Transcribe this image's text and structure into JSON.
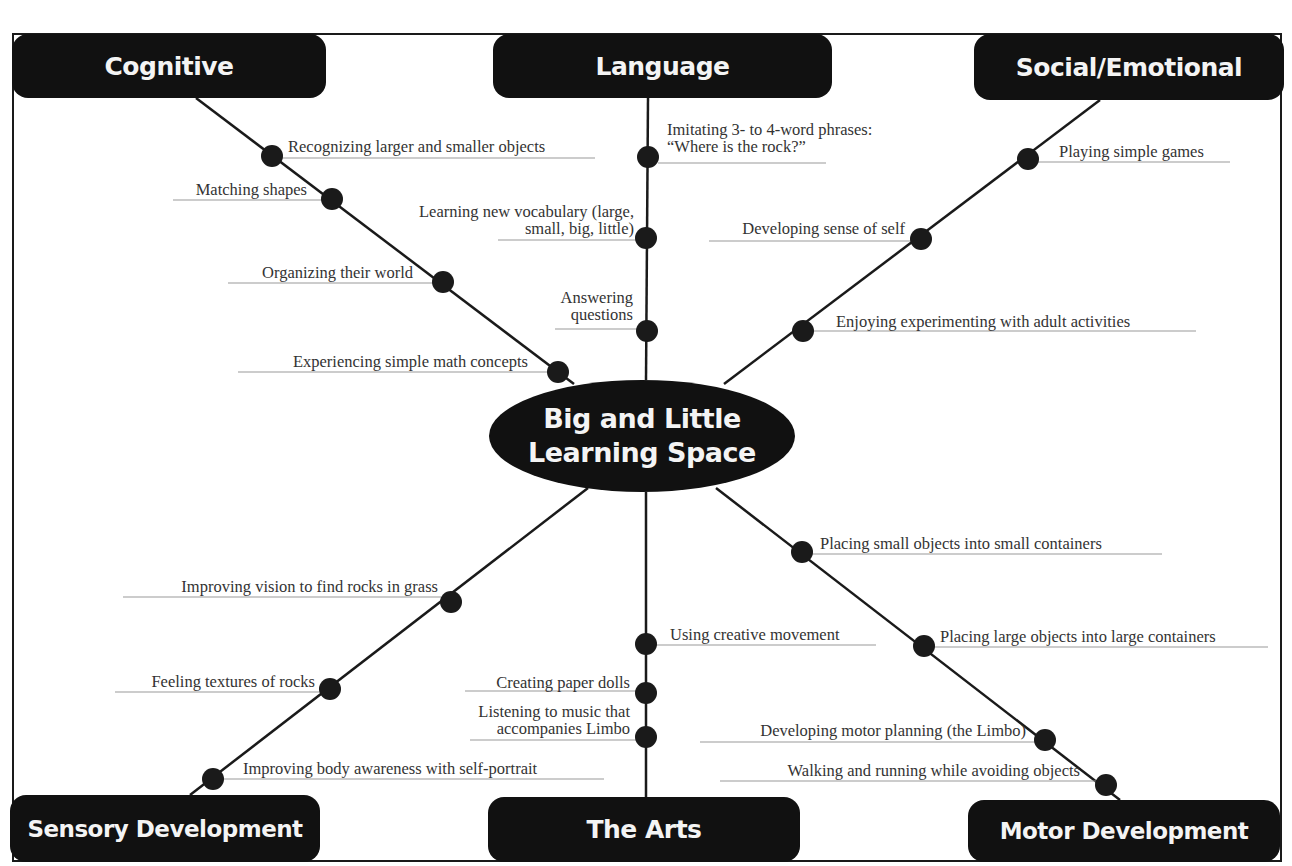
{
  "diagram": {
    "title_cropped": "",
    "center": {
      "line1": "Big and Little",
      "line2": "Learning Space",
      "cx": 642,
      "cy": 436
    },
    "colors": {
      "box_fill": "#111111",
      "box_text": "#f4f4f4",
      "line": "#1a1a1a",
      "dot": "#1a1a1a",
      "label_text": "#333333",
      "leader": "#999999"
    },
    "categories": [
      {
        "id": "cognitive",
        "label": "Cognitive",
        "x": 12,
        "y": 34,
        "w": 314,
        "h": 64,
        "font": 25,
        "anchor": [
          196,
          98
        ]
      },
      {
        "id": "language",
        "label": "Language",
        "x": 493,
        "y": 34,
        "w": 339,
        "h": 64,
        "font": 25,
        "anchor": [
          648,
          98
        ]
      },
      {
        "id": "social-emotional",
        "label": "Social/Emotional",
        "x": 974,
        "y": 34,
        "w": 310,
        "h": 66,
        "font": 25,
        "anchor": [
          1100,
          100
        ]
      },
      {
        "id": "sensory-development",
        "label": "Sensory Development",
        "x": 10,
        "y": 795,
        "w": 310,
        "h": 67,
        "font": 23,
        "anchor": [
          190,
          795
        ]
      },
      {
        "id": "the-arts",
        "label": "The Arts",
        "x": 488,
        "y": 797,
        "w": 312,
        "h": 65,
        "font": 25,
        "anchor": [
          646,
          797
        ]
      },
      {
        "id": "motor-development",
        "label": "Motor Development",
        "x": 968,
        "y": 800,
        "w": 312,
        "h": 62,
        "font": 23,
        "anchor": [
          1120,
          800
        ]
      }
    ],
    "branches": [
      {
        "category": "cognitive",
        "from": [
          196,
          98
        ],
        "to": [
          574,
          384
        ],
        "items": [
          {
            "text": [
              "Recognizing larger and smaller objects"
            ],
            "dot": [
              272,
              156
            ],
            "side": "right",
            "lx": 288,
            "ly": 138,
            "uline": [
              282,
              595,
              158
            ]
          },
          {
            "text": [
              "Matching shapes"
            ],
            "dot": [
              332,
              199
            ],
            "side": "left",
            "rx": 307,
            "ly": 181,
            "uline": [
              173,
              322,
              200
            ]
          },
          {
            "text": [
              "Organizing their world"
            ],
            "dot": [
              443,
              282
            ],
            "side": "left",
            "rx": 413,
            "ly": 264,
            "uline": [
              228,
              433,
              283
            ]
          },
          {
            "text": [
              "Experiencing simple math concepts"
            ],
            "dot": [
              558,
              372
            ],
            "side": "left",
            "rx": 528,
            "ly": 353,
            "uline": [
              238,
              548,
              372
            ]
          }
        ]
      },
      {
        "category": "language",
        "from": [
          648,
          98
        ],
        "to": [
          646,
          380
        ],
        "items": [
          {
            "text": [
              "Imitating 3- to 4-word phrases:",
              "“Where is the rock?”"
            ],
            "dot": [
              648,
              157
            ],
            "side": "right",
            "lx": 667,
            "ly": 121,
            "uline": [
              658,
              826,
              163
            ]
          },
          {
            "text": [
              "Learning new vocabulary (large,",
              "small, big, little)"
            ],
            "dot": [
              646,
              238
            ],
            "side": "left",
            "rx": 634,
            "ly": 203,
            "uline": [
              498,
              636,
              240
            ]
          },
          {
            "text": [
              "Answering",
              "questions"
            ],
            "dot": [
              647,
              331
            ],
            "side": "left",
            "rx": 633,
            "ly": 289,
            "uline": [
              555,
              637,
              329
            ]
          }
        ]
      },
      {
        "category": "social-emotional",
        "from": [
          1100,
          100
        ],
        "to": [
          724,
          384
        ],
        "items": [
          {
            "text": [
              "Playing simple games"
            ],
            "dot": [
              1028,
              159
            ],
            "side": "right",
            "lx": 1059,
            "ly": 143,
            "uline": [
              1038,
              1230,
              162
            ]
          },
          {
            "text": [
              "Developing sense of self"
            ],
            "dot": [
              921,
              239
            ],
            "side": "left",
            "rx": 905,
            "ly": 220,
            "uline": [
              709,
              911,
              241
            ]
          },
          {
            "text": [
              "Enjoying experimenting with adult activities"
            ],
            "dot": [
              803,
              331
            ],
            "side": "right",
            "lx": 836,
            "ly": 313,
            "uline": [
              813,
              1196,
              331
            ]
          }
        ]
      },
      {
        "category": "sensory-development",
        "from": [
          588,
          488
        ],
        "to": [
          190,
          795
        ],
        "items": [
          {
            "text": [
              "Improving vision to find rocks in grass"
            ],
            "dot": [
              451,
              602
            ],
            "side": "left",
            "rx": 438,
            "ly": 578,
            "uline": [
              123,
              441,
              597
            ]
          },
          {
            "text": [
              "Feeling textures of rocks"
            ],
            "dot": [
              330,
              689
            ],
            "side": "left",
            "rx": 315,
            "ly": 673,
            "uline": [
              115,
              320,
              692
            ]
          },
          {
            "text": [
              "Improving body awareness with self-portrait"
            ],
            "dot": [
              213,
              779
            ],
            "side": "right",
            "lx": 243,
            "ly": 760,
            "uline": [
              223,
              604,
              779
            ]
          }
        ]
      },
      {
        "category": "the-arts",
        "from": [
          646,
          492
        ],
        "to": [
          646,
          797
        ],
        "items": [
          {
            "text": [
              "Using creative movement"
            ],
            "dot": [
              646,
              644
            ],
            "side": "right",
            "lx": 670,
            "ly": 626,
            "uline": [
              656,
              876,
              645
            ]
          },
          {
            "text": [
              "Creating paper dolls"
            ],
            "dot": [
              646,
              693
            ],
            "side": "left",
            "rx": 630,
            "ly": 674,
            "uline": [
              465,
              636,
              691
            ]
          },
          {
            "text": [
              "Listening to music that",
              "accompanies Limbo"
            ],
            "dot": [
              646,
              737
            ],
            "side": "left",
            "rx": 630,
            "ly": 703,
            "uline": [
              470,
              636,
              740
            ]
          }
        ]
      },
      {
        "category": "motor-development",
        "from": [
          716,
          488
        ],
        "to": [
          1120,
          800
        ],
        "items": [
          {
            "text": [
              "Placing small objects into small containers"
            ],
            "dot": [
              802,
              552
            ],
            "side": "right",
            "lx": 820,
            "ly": 535,
            "uline": [
              812,
              1162,
              554
            ]
          },
          {
            "text": [
              "Placing large objects into large containers"
            ],
            "dot": [
              924,
              646
            ],
            "side": "right",
            "lx": 940,
            "ly": 628,
            "uline": [
              934,
              1268,
              647
            ]
          },
          {
            "text": [
              "Developing motor planning (the Limbo)"
            ],
            "dot": [
              1045,
              740
            ],
            "side": "left",
            "rx": 1026,
            "ly": 722,
            "uline": [
              700,
              1035,
              742
            ]
          },
          {
            "text": [
              "Walking and running while avoiding objects"
            ],
            "dot": [
              1106,
              785
            ],
            "side": "left",
            "rx": 1080,
            "ly": 762,
            "uline": [
              720,
              1096,
              781
            ]
          }
        ]
      }
    ]
  }
}
